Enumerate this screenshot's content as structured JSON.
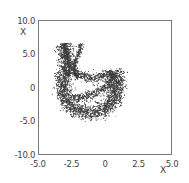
{
  "chart_data": {
    "type": "scatter",
    "title": "",
    "subtitle": "",
    "xlabel": "X",
    "ylabel": "X",
    "xlim": [
      -5.0,
      5.0
    ],
    "ylim": [
      -10.0,
      10.0
    ],
    "grid": false,
    "legend": null,
    "legend_position": "none",
    "marker": {
      "shape": "dot",
      "size": 1.1,
      "color": "#3a3a3a",
      "count": 620
    },
    "xticks": [
      -5.0,
      -2.5,
      0,
      2.5,
      5.0
    ],
    "xticklabels": [
      "-5.0",
      "-2.5",
      "0",
      "2.5",
      "5.0"
    ],
    "yticks": [
      10.0,
      5.0,
      0,
      -5.0,
      -10.0
    ],
    "yticklabels": [
      "10.0",
      "5.0",
      "0",
      "-5.0",
      "-10.0"
    ],
    "shape_paths": [
      {
        "name": "outer-crescent",
        "comment": "Thick outer arc from upper-left tendril base sweeping down, around the bottom, and up the right side.",
        "points": [
          [
            -3.1,
            6.55
          ],
          [
            -3.05,
            6.1
          ],
          [
            -3.0,
            5.6
          ],
          [
            -2.96,
            5.1
          ],
          [
            -2.93,
            4.6
          ],
          [
            -2.92,
            4.1
          ],
          [
            -2.93,
            3.6
          ],
          [
            -2.96,
            3.1
          ],
          [
            -3.0,
            2.6
          ],
          [
            -3.06,
            2.1
          ],
          [
            -3.12,
            1.6
          ],
          [
            -3.18,
            1.1
          ],
          [
            -3.22,
            0.6
          ],
          [
            -3.24,
            0.1
          ],
          [
            -3.24,
            -0.4
          ],
          [
            -3.2,
            -0.9
          ],
          [
            -3.12,
            -1.4
          ],
          [
            -3.0,
            -1.9
          ],
          [
            -2.84,
            -2.35
          ],
          [
            -2.64,
            -2.75
          ],
          [
            -2.4,
            -3.1
          ],
          [
            -2.12,
            -3.38
          ],
          [
            -1.82,
            -3.58
          ],
          [
            -1.5,
            -3.7
          ],
          [
            -1.18,
            -3.76
          ],
          [
            -0.86,
            -3.74
          ],
          [
            -0.56,
            -3.64
          ],
          [
            -0.28,
            -3.46
          ],
          [
            -0.04,
            -3.22
          ],
          [
            0.18,
            -2.92
          ],
          [
            0.36,
            -2.58
          ],
          [
            0.52,
            -2.2
          ],
          [
            0.64,
            -1.8
          ],
          [
            0.74,
            -1.38
          ],
          [
            0.82,
            -0.94
          ],
          [
            0.88,
            -0.5
          ],
          [
            0.92,
            -0.06
          ],
          [
            0.94,
            0.38
          ],
          [
            0.94,
            0.82
          ],
          [
            0.92,
            1.26
          ],
          [
            0.88,
            1.68
          ],
          [
            0.8,
            2.08
          ],
          [
            0.7,
            2.42
          ]
        ]
      },
      {
        "name": "inner-boundary",
        "comment": "Inner edge of the crescent enclosing the hollow region.",
        "points": [
          [
            -2.3,
            2.55
          ],
          [
            -2.12,
            2.2
          ],
          [
            -1.92,
            1.88
          ],
          [
            -1.68,
            1.62
          ],
          [
            -1.4,
            1.44
          ],
          [
            -1.1,
            1.36
          ],
          [
            -0.8,
            1.36
          ],
          [
            -0.5,
            1.44
          ],
          [
            -0.22,
            1.58
          ],
          [
            0.04,
            1.76
          ],
          [
            0.26,
            1.96
          ],
          [
            0.46,
            2.16
          ],
          [
            0.62,
            2.34
          ]
        ]
      },
      {
        "name": "inner-lower-boundary",
        "comment": "Lower inner edge sweeping back left to close the hollow.",
        "points": [
          [
            0.46,
            1.1
          ],
          [
            0.34,
            0.66
          ],
          [
            0.18,
            0.26
          ],
          [
            -0.02,
            -0.1
          ],
          [
            -0.26,
            -0.42
          ],
          [
            -0.54,
            -0.7
          ],
          [
            -0.84,
            -0.94
          ],
          [
            -1.16,
            -1.14
          ],
          [
            -1.48,
            -1.3
          ],
          [
            -1.8,
            -1.44
          ],
          [
            -2.1,
            -1.58
          ],
          [
            -2.36,
            -1.76
          ]
        ]
      },
      {
        "name": "tendril-left",
        "comment": "Thin left tendril rising to top-left.",
        "points": [
          [
            -3.1,
            6.55
          ],
          [
            -3.04,
            6.0
          ],
          [
            -2.96,
            5.45
          ],
          [
            -2.88,
            4.9
          ],
          [
            -2.8,
            4.35
          ],
          [
            -2.74,
            3.8
          ],
          [
            -2.7,
            3.25
          ],
          [
            -2.68,
            2.7
          ],
          [
            -2.7,
            2.2
          ],
          [
            -2.76,
            1.74
          ]
        ]
      },
      {
        "name": "tendril-right",
        "comment": "Thin right tendril rising to top, hooking left at its base.",
        "points": [
          [
            -1.8,
            6.6
          ],
          [
            -1.86,
            6.05
          ],
          [
            -1.94,
            5.5
          ],
          [
            -2.04,
            4.95
          ],
          [
            -2.14,
            4.4
          ],
          [
            -2.24,
            3.88
          ],
          [
            -2.32,
            3.36
          ],
          [
            -2.36,
            2.88
          ],
          [
            -2.36,
            2.44
          ],
          [
            -2.3,
            2.06
          ],
          [
            -2.18,
            1.76
          ],
          [
            -2.0,
            1.56
          ]
        ]
      }
    ]
  }
}
